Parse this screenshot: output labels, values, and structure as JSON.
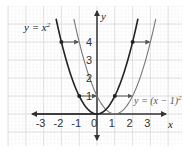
{
  "chart_data": {
    "type": "line",
    "title": "",
    "xlabel": "x",
    "ylabel": "y",
    "xlim": [
      -3.5,
      3.8
    ],
    "ylim": [
      -1.4,
      5.6
    ],
    "grid": true,
    "x_ticks": [
      "-3",
      "-2",
      "-1",
      "0",
      "1",
      "2",
      "3"
    ],
    "y_ticks": [
      "1",
      "2",
      "3",
      "4"
    ],
    "series": [
      {
        "name": "y = x²",
        "label": "y = x²",
        "color": "#222222",
        "style": "solid-dark",
        "x": [
          -2.3,
          -2,
          -1.5,
          -1,
          -0.5,
          0,
          0.5,
          1,
          1.5,
          2,
          2.3
        ],
        "y": [
          5.29,
          4,
          2.25,
          1,
          0.25,
          0,
          0.25,
          1,
          2.25,
          4,
          5.29
        ]
      },
      {
        "name": "y = (x − 1)²",
        "label": "y = (x − 1)²",
        "color": "#777777",
        "style": "solid-light",
        "x": [
          -1.3,
          -1,
          -0.5,
          0,
          0.5,
          1,
          1.5,
          2,
          2.5,
          3,
          3.3
        ],
        "y": [
          5.29,
          4,
          2.25,
          1,
          0.25,
          0,
          0.25,
          1,
          2.25,
          4,
          5.29
        ]
      }
    ],
    "annotations": [
      {
        "type": "arrow",
        "from": [
          -2,
          4
        ],
        "to": [
          -1,
          4
        ],
        "note": "translation 1 unit right"
      },
      {
        "type": "arrow",
        "from": [
          2,
          4
        ],
        "to": [
          3,
          4
        ],
        "note": "translation 1 unit right"
      },
      {
        "type": "arrow",
        "from": [
          -1,
          1
        ],
        "to": [
          0,
          1
        ],
        "note": "translation 1 unit right"
      },
      {
        "type": "arrow",
        "from": [
          1,
          1
        ],
        "to": [
          2,
          1
        ],
        "note": "translation 1 unit right"
      }
    ],
    "legend": "inline labels",
    "label_positions": {
      "y = x²": "top-left",
      "y = (x − 1)²": "right, near y=1"
    }
  },
  "labels": {
    "x_axis": "x",
    "y_axis": "y",
    "curve1": "y = x",
    "curve1_exp": "2",
    "curve2": "y = (x − 1)",
    "curve2_exp": "2",
    "x_ticks": [
      "-3",
      "-2",
      "-1",
      "0",
      "1",
      "2",
      "3"
    ],
    "y_ticks": [
      "1",
      "2",
      "3",
      "4"
    ]
  }
}
